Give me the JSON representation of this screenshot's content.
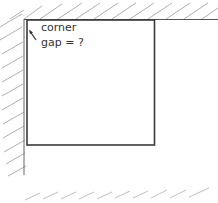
{
  "diagram": {
    "type": "line-drawing",
    "annotation": {
      "line1": "corner",
      "line2": "gap = ?"
    },
    "elements": {
      "wall": {
        "x": 24,
        "y_top": 19,
        "y_bottom": 175,
        "hatch_side": "left"
      },
      "ceiling": {
        "y": 19,
        "x_left": 24,
        "x_right": 218,
        "hatch_side": "top"
      },
      "floor": {
        "y": 195,
        "x_left": 25,
        "x_right": 215,
        "hatch_only": true
      },
      "box": {
        "x": 27,
        "y": 19,
        "width": 128,
        "height": 126
      }
    },
    "colors": {
      "stroke": "#444444",
      "hatch": "#999999",
      "background": "#ffffff"
    }
  }
}
